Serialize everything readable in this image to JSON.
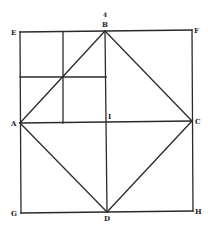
{
  "figure": {
    "figure_number": "4",
    "stroke_color": "#2a2a2a",
    "background": "#ffffff",
    "points": {
      "E": {
        "x": 20,
        "y": 32
      },
      "B": {
        "x": 105,
        "y": 31
      },
      "F": {
        "x": 192,
        "y": 30
      },
      "A": {
        "x": 20,
        "y": 123
      },
      "I": {
        "x": 106,
        "y": 122
      },
      "C": {
        "x": 192,
        "y": 121
      },
      "G": {
        "x": 21,
        "y": 213
      },
      "D": {
        "x": 107,
        "y": 212
      },
      "H": {
        "x": 193,
        "y": 211
      }
    },
    "labels": {
      "E": "E",
      "B": "B",
      "F": "F",
      "A": "A",
      "I": "I",
      "C": "C",
      "G": "G",
      "D": "D",
      "H": "H"
    },
    "segments": [
      [
        "E",
        "F"
      ],
      [
        "F",
        "H"
      ],
      [
        "H",
        "G"
      ],
      [
        "G",
        "E"
      ],
      [
        "A",
        "B"
      ],
      [
        "B",
        "C"
      ],
      [
        "C",
        "D"
      ],
      [
        "D",
        "A"
      ],
      [
        "A",
        "C"
      ],
      [
        "B",
        "D"
      ]
    ],
    "subdivisions": {
      "vertical": {
        "x": 63,
        "y1": 32,
        "y2": 123
      },
      "horizontal": {
        "y": 77,
        "x1": 20,
        "x2": 106
      }
    }
  }
}
